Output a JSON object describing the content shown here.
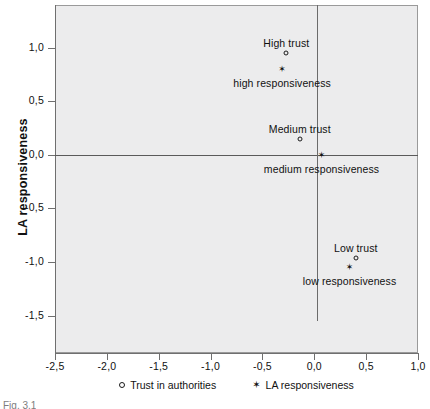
{
  "chart_data": {
    "type": "scatter",
    "title": "",
    "xlabel": "",
    "ylabel": "LA responsiveness",
    "xlim": [
      -2.5,
      1.0
    ],
    "ylim": [
      -1.85,
      1.4
    ],
    "xticks": [
      "-2,5",
      "-2,0",
      "-1,5",
      "-1,0",
      "-0,5",
      "0,0",
      "0,5",
      "1,0"
    ],
    "xtick_values": [
      -2.5,
      -2.0,
      -1.5,
      -1.0,
      -0.5,
      0.0,
      0.5,
      1.0
    ],
    "yticks": [
      "1,0",
      "0,5",
      "0,0",
      "-0,5",
      "-1,0",
      "-1,5"
    ],
    "ytick_values": [
      1.0,
      0.5,
      0.0,
      -0.5,
      -1.0,
      -1.5
    ],
    "grid": false,
    "legend_position": "bottom-center",
    "reference_lines": [
      {
        "orientation": "horizontal",
        "value": 0.0,
        "extent": "full"
      },
      {
        "orientation": "vertical",
        "value": 0.03,
        "extent": "partial",
        "from": 1.4,
        "to": -1.55
      }
    ],
    "series": [
      {
        "name": "Trust in authorities",
        "marker": "open-circle",
        "points": [
          {
            "label": "High trust",
            "x": -0.27,
            "y": 0.95,
            "label_position": "above"
          },
          {
            "label": "Medium trust",
            "x": -0.14,
            "y": 0.15,
            "label_position": "above"
          },
          {
            "label": "Low trust",
            "x": 0.4,
            "y": -0.96,
            "label_position": "above"
          }
        ]
      },
      {
        "name": "LA responsiveness",
        "marker": "star",
        "points": [
          {
            "label": "high responsiveness",
            "x": -0.31,
            "y": 0.8,
            "label_position": "below"
          },
          {
            "label": "medium responsiveness",
            "x": 0.07,
            "y": 0.0,
            "label_position": "below"
          },
          {
            "label": "low responsiveness",
            "x": 0.34,
            "y": -1.05,
            "label_position": "below"
          }
        ]
      }
    ]
  },
  "axis": {
    "y_title": "LA responsiveness",
    "y_tick_labels": [
      "1,0",
      "0,5",
      "0,0",
      "-0,5",
      "-1,0",
      "-1,5"
    ],
    "x_tick_labels": [
      "-2,5",
      "-2,0",
      "-1,5",
      "-1,0",
      "-0,5",
      "0,0",
      "0,5",
      "1,0"
    ]
  },
  "legend": {
    "items": [
      {
        "glyph": "open-circle-icon",
        "label": "Trust in authorities"
      },
      {
        "glyph": "star-icon",
        "label": "LA responsiveness"
      }
    ]
  },
  "point_labels": {
    "high_trust": "High trust",
    "high_responsiveness": "high responsiveness",
    "medium_trust": "Medium trust",
    "medium_responsiveness": "medium responsiveness",
    "low_trust": "Low trust",
    "low_responsiveness": "low responsiveness"
  },
  "caption": "Fig. 3.1",
  "colors": {
    "plot_background": "#ececed",
    "page_background": "#ffffff",
    "axis_line": "#6f6f6f",
    "reference_line": "#5a5a5a",
    "text": "#111111"
  }
}
